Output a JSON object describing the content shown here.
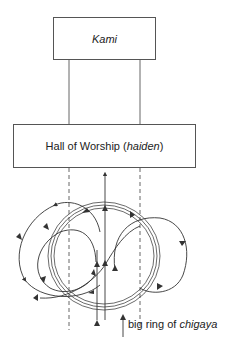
{
  "diagram": {
    "kami_box": {
      "label": "Kami"
    },
    "hall_box": {
      "label_prefix": "Hall of Worship (",
      "label_italic": "haiden",
      "label_suffix": ")"
    },
    "ring_caption": {
      "prefix": "big ring of ",
      "italic": "chigaya"
    },
    "colors": {
      "line": "#333333",
      "box_border": "#555555",
      "background": "#ffffff"
    }
  }
}
